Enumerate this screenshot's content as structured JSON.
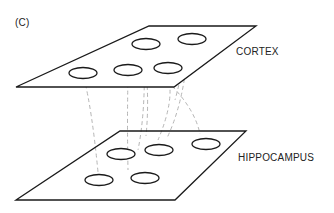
{
  "panel_label": "(C)",
  "layers": [
    {
      "name": "CORTEX",
      "units": 5
    },
    {
      "name": "HIPPOCAMPUS",
      "units": 5
    }
  ],
  "connections": "dashed lines linking cortical units to hippocampal units",
  "colors": {
    "line": "#1a1a1a",
    "dash": "#b5b5b5"
  }
}
